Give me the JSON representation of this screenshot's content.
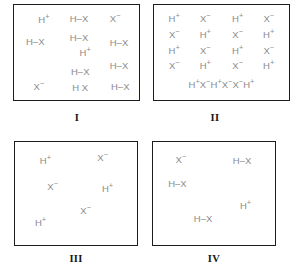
{
  "figure": {
    "background_color": "#ffffff",
    "species_text_color": "#8c8c8c",
    "border_color": "#1c1c1c",
    "caption_color": "#161616",
    "panels": [
      {
        "caption": "I",
        "layout": "scatter",
        "species": [
          {
            "label": "H+",
            "base": "H",
            "sup": "+",
            "x": 24,
            "y": 16
          },
          {
            "label": "H-X",
            "base": "H–X",
            "sup": "",
            "x": 52,
            "y": 15
          },
          {
            "label": "X-",
            "base": "X",
            "sup": "−",
            "x": 81,
            "y": 15
          },
          {
            "label": "H-X",
            "base": "H–X",
            "sup": "",
            "x": 17,
            "y": 39
          },
          {
            "label": "H-X",
            "base": "H–X",
            "sup": "",
            "x": 52,
            "y": 35
          },
          {
            "label": "H-X",
            "base": "H–X",
            "sup": "",
            "x": 84,
            "y": 40
          },
          {
            "label": "H+",
            "base": "H",
            "sup": "+",
            "x": 57,
            "y": 50
          },
          {
            "label": "H-X",
            "base": "H–X",
            "sup": "",
            "x": 84,
            "y": 64
          },
          {
            "label": "H-X",
            "base": "H–X",
            "sup": "",
            "x": 53,
            "y": 71
          },
          {
            "label": "X-",
            "base": "X",
            "sup": "−",
            "x": 20,
            "y": 86
          },
          {
            "label": "H X",
            "base": "H X",
            "sup": "",
            "x": 53,
            "y": 87
          },
          {
            "label": "H-X",
            "base": "H–X",
            "sup": "",
            "x": 85,
            "y": 86
          }
        ]
      },
      {
        "caption": "II",
        "layout": "grid",
        "grid_rows": [
          [
            "H+",
            "X-",
            "H+",
            "X-"
          ],
          [
            "X-",
            "H+",
            "X-",
            "H+"
          ],
          [
            "H+",
            "X-",
            "H+",
            "X-"
          ],
          [
            "X-",
            "H+",
            "X-",
            "H+"
          ]
        ],
        "grid_row_y": [
          15,
          32,
          48,
          64
        ],
        "grid_col_x": [
          15,
          38,
          62,
          85
        ],
        "dense_row": [
          "H+",
          "X-",
          "H+",
          "X-",
          "X-",
          "H+"
        ],
        "dense_row_y": 84
      },
      {
        "caption": "III",
        "layout": "scatter",
        "species": [
          {
            "label": "H+",
            "base": "H",
            "sup": "+",
            "x": 25,
            "y": 18
          },
          {
            "label": "X-",
            "base": "X",
            "sup": "−",
            "x": 72,
            "y": 16
          },
          {
            "label": "X-",
            "base": "X",
            "sup": "−",
            "x": 31,
            "y": 44
          },
          {
            "label": "H+",
            "base": "H",
            "sup": "+",
            "x": 76,
            "y": 46
          },
          {
            "label": "X-",
            "base": "X",
            "sup": "−",
            "x": 58,
            "y": 67
          },
          {
            "label": "H+",
            "base": "H",
            "sup": "+",
            "x": 21,
            "y": 79
          }
        ]
      },
      {
        "caption": "IV",
        "layout": "scatter",
        "species": [
          {
            "label": "X-",
            "base": "X",
            "sup": "−",
            "x": 23,
            "y": 17
          },
          {
            "label": "H-X",
            "base": "H–X",
            "sup": "",
            "x": 73,
            "y": 18
          },
          {
            "label": "H-X",
            "base": "H–X",
            "sup": "",
            "x": 20,
            "y": 41
          },
          {
            "label": "H+",
            "base": "H",
            "sup": "+",
            "x": 76,
            "y": 62
          },
          {
            "label": "H-X",
            "base": "H–X",
            "sup": "",
            "x": 41,
            "y": 75
          }
        ]
      }
    ]
  }
}
